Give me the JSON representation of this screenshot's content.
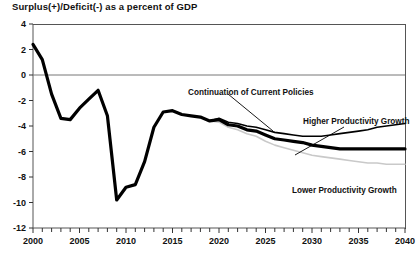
{
  "chart_data": {
    "type": "line",
    "title": "Surplus(+)/Deficit(-) as a percent of GDP",
    "xlabel": "",
    "ylabel": "",
    "xlim": [
      2000,
      2040
    ],
    "ylim": [
      -12,
      4
    ],
    "yticks": [
      4,
      2,
      0,
      -2,
      -4,
      -6,
      -8,
      -10,
      -12
    ],
    "ytick_labels": [
      "4",
      "2",
      "0",
      "-2",
      "-4",
      "-6",
      "-8",
      "-10",
      "-12"
    ],
    "xticks": [
      2000,
      2005,
      2010,
      2015,
      2020,
      2025,
      2030,
      2035,
      2040
    ],
    "xtick_labels": [
      "2000",
      "2005",
      "2010",
      "2015",
      "2020",
      "2025",
      "2030",
      "2035",
      "2040"
    ],
    "x_minor_tick_step": 1,
    "grid": false,
    "zero_line": 0,
    "legend_position": "inline-annotations",
    "series": [
      {
        "name": "Continuation of Current Policies",
        "color": "#000000",
        "width": 3.2,
        "x": [
          2000,
          2001,
          2002,
          2003,
          2004,
          2005,
          2006,
          2007,
          2008,
          2009,
          2010,
          2011,
          2012,
          2013,
          2014,
          2015,
          2016,
          2017,
          2018,
          2019,
          2020,
          2021,
          2022,
          2023,
          2024,
          2025,
          2026,
          2027,
          2028,
          2029,
          2030,
          2031,
          2032,
          2033,
          2034,
          2035,
          2036,
          2037,
          2038,
          2039,
          2040
        ],
        "values": [
          2.4,
          1.2,
          -1.5,
          -3.4,
          -3.5,
          -2.6,
          -1.9,
          -1.2,
          -3.2,
          -9.8,
          -8.8,
          -8.6,
          -6.8,
          -4.1,
          -2.9,
          -2.8,
          -3.1,
          -3.2,
          -3.3,
          -3.6,
          -3.5,
          -3.9,
          -4.0,
          -4.3,
          -4.4,
          -4.7,
          -5.0,
          -5.1,
          -5.2,
          -5.3,
          -5.5,
          -5.6,
          -5.7,
          -5.8,
          -5.8,
          -5.8,
          -5.8,
          -5.8,
          -5.8,
          -5.8,
          -5.8
        ]
      },
      {
        "name": "Higher Productivity Growth",
        "color": "#000000",
        "width": 1.6,
        "x": [
          2019,
          2020,
          2021,
          2022,
          2023,
          2024,
          2025,
          2026,
          2027,
          2028,
          2029,
          2030,
          2031,
          2032,
          2033,
          2034,
          2035,
          2036,
          2037,
          2038,
          2039,
          2040
        ],
        "values": [
          -3.6,
          -3.4,
          -3.7,
          -3.8,
          -4.0,
          -4.1,
          -4.3,
          -4.5,
          -4.6,
          -4.7,
          -4.8,
          -4.8,
          -4.8,
          -4.7,
          -4.6,
          -4.5,
          -4.4,
          -4.3,
          -4.1,
          -4.0,
          -3.9,
          -3.8
        ]
      },
      {
        "name": "Lower Productivity Growth",
        "color": "#c9c9c9",
        "width": 1.6,
        "x": [
          2019,
          2020,
          2021,
          2022,
          2023,
          2024,
          2025,
          2026,
          2027,
          2028,
          2029,
          2030,
          2031,
          2032,
          2033,
          2034,
          2035,
          2036,
          2037,
          2038,
          2039,
          2040
        ],
        "values": [
          -3.6,
          -3.7,
          -4.1,
          -4.3,
          -4.6,
          -4.8,
          -5.2,
          -5.5,
          -5.7,
          -5.9,
          -6.1,
          -6.3,
          -6.4,
          -6.5,
          -6.6,
          -6.7,
          -6.8,
          -6.9,
          -6.9,
          -7.0,
          -7.0,
          -7.0
        ]
      }
    ],
    "annotations": [
      {
        "id": "continuation",
        "text": "Continuation of Current Policies",
        "text_x": 188,
        "text_y": 88,
        "leader": {
          "x1": 228,
          "y1": 94,
          "x2": 273,
          "y2": 131
        }
      },
      {
        "id": "higher",
        "text": "Higher Productivity Growth",
        "text_x": 303,
        "text_y": 117,
        "leader": {
          "x1": 344,
          "y1": 127,
          "x2": 295,
          "y2": 155
        }
      },
      {
        "id": "lower",
        "text": "Lower Productivity Growth",
        "text_x": 292,
        "text_y": 186,
        "leader": null
      }
    ]
  },
  "axis_style": {
    "axis_color": "#555555",
    "zero_line_color": "#777777",
    "tick_color": "#333333"
  }
}
